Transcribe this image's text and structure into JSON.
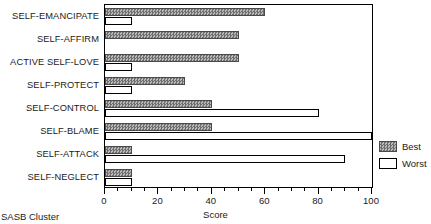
{
  "chart_data": {
    "type": "bar",
    "orientation": "horizontal",
    "title": "",
    "xlabel": "Score",
    "ylabel": "SASB Cluster",
    "xlim": [
      0,
      100
    ],
    "ylim": null,
    "grid": false,
    "legend_position": "right",
    "xticks": [
      0,
      20,
      40,
      60,
      80,
      100
    ],
    "xticklabels": [
      "0",
      "20",
      "40",
      "60",
      "80",
      "100"
    ],
    "minor_tick_step": 5,
    "categories": [
      "SELF-EMANCIPATE",
      "SELF-AFFIRM",
      "ACTIVE SELF-LOVE",
      "SELF-PROTECT",
      "SELF-CONTROL",
      "SELF-BLAME",
      "SELF-ATTACK",
      "SELF-NEGLECT"
    ],
    "series": [
      {
        "name": "Best",
        "color": "#8a8a8a",
        "pattern": "checkered",
        "values": [
          60,
          50,
          50,
          30,
          40,
          40,
          10,
          10
        ]
      },
      {
        "name": "Worst",
        "color": "#ffffff",
        "pattern": "solid-outline",
        "values": [
          10,
          0,
          10,
          10,
          80,
          100,
          90,
          10
        ]
      }
    ]
  },
  "legend": {
    "items": [
      {
        "label": "Best"
      },
      {
        "label": "Worst"
      }
    ]
  },
  "axes": {
    "x_title": "Score",
    "y_title": "SASB Cluster"
  }
}
